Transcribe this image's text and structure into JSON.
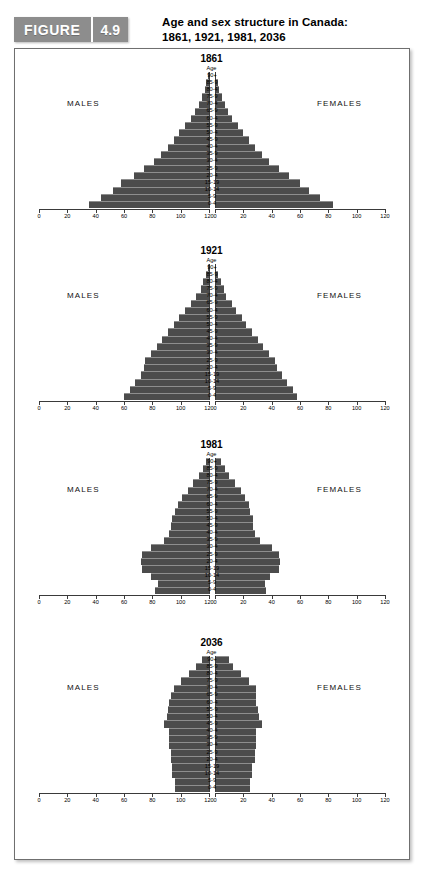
{
  "header": {
    "figure_word": "FIGURE",
    "figure_number": "4.9",
    "title_line1": "Age and sex structure in Canada:",
    "title_line2": "1861, 1921, 1981, 2036"
  },
  "labels": {
    "males": "MALES",
    "females": "FEMALES",
    "age_header": "Age"
  },
  "colors": {
    "bar": "#4c4c4c",
    "banner": "#8d8d8d",
    "frame": "#6f6f6f",
    "axis": "#3a3a3a"
  },
  "chart_data": {
    "type": "bar",
    "title": "Age and sex structure in Canada: 1861, 1921, 1981, 2036",
    "subtype": "population-pyramid",
    "xlabel": "",
    "ylabel": "Age",
    "xlim": [
      0,
      120
    ],
    "xticks": [
      0,
      20,
      40,
      60,
      80,
      100,
      120
    ],
    "xticklabels_left": [
      "120",
      "100",
      "80",
      "60",
      "40",
      "20",
      "0"
    ],
    "xticklabels_right": [
      "0",
      "20",
      "40",
      "60",
      "80",
      "100",
      "120"
    ],
    "grid": false,
    "legend": "none",
    "age_groups": [
      "90+",
      "85-9",
      "80-4",
      "75-9",
      "70-4",
      "65-9",
      "60-4",
      "55-9",
      "50-4",
      "45-9",
      "40-4",
      "35-9",
      "30-4",
      "25-9",
      "20-4",
      "15-19",
      "10-14",
      "5-9",
      "0-4"
    ],
    "panels": [
      {
        "title": "1861",
        "series": [
          {
            "name": "MALES",
            "side": "left",
            "values": [
              1,
              2,
              3,
              5,
              7,
              10,
              13,
              17,
              21,
              25,
              29,
              34,
              39,
              46,
              53,
              62,
              68,
              76,
              85
            ]
          },
          {
            "name": "FEMALES",
            "side": "right",
            "values": [
              1,
              2,
              3,
              5,
              7,
              9,
              12,
              16,
              20,
              24,
              28,
              33,
              38,
              45,
              52,
              60,
              66,
              74,
              83
            ]
          }
        ]
      },
      {
        "title": "1921",
        "series": [
          {
            "name": "MALES",
            "side": "left",
            "values": [
              1,
              2,
              4,
              6,
              9,
              13,
              17,
              21,
              25,
              29,
              33,
              37,
              41,
              45,
              46,
              48,
              52,
              56,
              60
            ]
          },
          {
            "name": "FEMALES",
            "side": "right",
            "values": [
              1,
              2,
              4,
              6,
              8,
              12,
              15,
              19,
              22,
              26,
              30,
              34,
              38,
              42,
              44,
              47,
              51,
              55,
              58
            ]
          }
        ]
      },
      {
        "title": "1981",
        "series": [
          {
            "name": "MALES",
            "side": "left",
            "values": [
              2,
              4,
              7,
              11,
              15,
              19,
              22,
              24,
              26,
              27,
              28,
              32,
              41,
              47,
              48,
              47,
              41,
              36,
              38
            ]
          },
          {
            "name": "FEMALES",
            "side": "right",
            "values": [
              4,
              7,
              10,
              14,
              18,
              21,
              24,
              25,
              27,
              27,
              28,
              32,
              40,
              45,
              46,
              45,
              39,
              35,
              36
            ]
          }
        ]
      },
      {
        "title": "2036",
        "series": [
          {
            "name": "MALES",
            "side": "left",
            "values": [
              5,
              9,
              14,
              20,
              25,
              27,
              28,
              29,
              30,
              32,
              28,
              28,
              28,
              27,
              27,
              26,
              26,
              24,
              24
            ]
          },
          {
            "name": "FEMALES",
            "side": "right",
            "values": [
              10,
              13,
              18,
              24,
              29,
              29,
              29,
              30,
              31,
              33,
              29,
              29,
              29,
              28,
              28,
              26,
              26,
              25,
              25
            ]
          }
        ]
      }
    ]
  }
}
